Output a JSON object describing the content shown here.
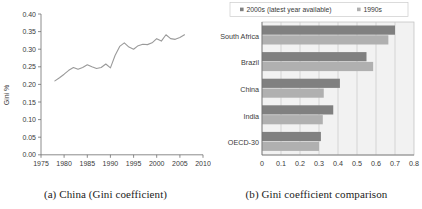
{
  "figure": {
    "panel_a": {
      "caption": "(a) China (Gini coefficient)",
      "ylabel": "Gini %",
      "y_ticks": [
        "0.00",
        "0.05",
        "0.10",
        "0.15",
        "0.20",
        "0.25",
        "0.30",
        "0.35",
        "0.40"
      ],
      "x_ticks": [
        "1975",
        "1980",
        "1985",
        "1990",
        "1995",
        "2000",
        "2005",
        "2010"
      ]
    },
    "panel_b": {
      "caption": "(b) Gini coefficient comparison",
      "legend": [
        {
          "label": "2000s (latest year available)",
          "color": "#808080"
        },
        {
          "label": "1990s",
          "color": "#b0b0b0"
        }
      ],
      "x_ticks": [
        "0",
        "0.1",
        "0.2",
        "0.3",
        "0.4",
        "0.5",
        "0.6",
        "0.7",
        "0.8"
      ],
      "categories": [
        "South Africa",
        "Brazil",
        "China",
        "India",
        "OECD-30"
      ]
    }
  },
  "chart_data": [
    {
      "type": "line",
      "title": "(a) China (Gini coefficient)",
      "xlabel": "",
      "ylabel": "Gini %",
      "xlim": [
        1975,
        2010
      ],
      "ylim": [
        0.0,
        0.4
      ],
      "grid": false,
      "legend": "none",
      "xticks": [
        1975,
        1980,
        1985,
        1990,
        1995,
        2000,
        2005,
        2010
      ],
      "yticks": [
        0.0,
        0.05,
        0.1,
        0.15,
        0.2,
        0.25,
        0.3,
        0.35,
        0.4
      ],
      "series": [
        {
          "name": "China Gini coefficient",
          "x": [
            1978,
            1979,
            1980,
            1981,
            1982,
            1983,
            1984,
            1985,
            1986,
            1987,
            1988,
            1989,
            1990,
            1991,
            1992,
            1993,
            1994,
            1995,
            1996,
            1997,
            1998,
            1999,
            2000,
            2001,
            2002,
            2003,
            2004,
            2005,
            2006
          ],
          "values": [
            0.21,
            0.219,
            0.229,
            0.24,
            0.248,
            0.243,
            0.248,
            0.256,
            0.25,
            0.245,
            0.248,
            0.258,
            0.247,
            0.282,
            0.308,
            0.318,
            0.306,
            0.3,
            0.31,
            0.314,
            0.313,
            0.318,
            0.33,
            0.323,
            0.341,
            0.33,
            0.328,
            0.333,
            0.341
          ]
        }
      ],
      "annotations": []
    },
    {
      "type": "bar",
      "orientation": "horizontal",
      "title": "(b) Gini coefficient comparison",
      "xlabel": "",
      "ylabel": "",
      "xlim": [
        0,
        0.8
      ],
      "xticks": [
        0,
        0.1,
        0.2,
        0.3,
        0.4,
        0.5,
        0.6,
        0.7,
        0.8
      ],
      "grid": true,
      "legend": "top",
      "categories": [
        "South Africa",
        "Brazil",
        "China",
        "India",
        "OECD-30"
      ],
      "series": [
        {
          "name": "2000s (latest year available)",
          "color": "#808080",
          "values": [
            0.7,
            0.55,
            0.41,
            0.375,
            0.31
          ]
        },
        {
          "name": "1990s",
          "color": "#b0b0b0",
          "values": [
            0.665,
            0.585,
            0.325,
            0.32,
            0.3
          ]
        }
      ]
    }
  ]
}
